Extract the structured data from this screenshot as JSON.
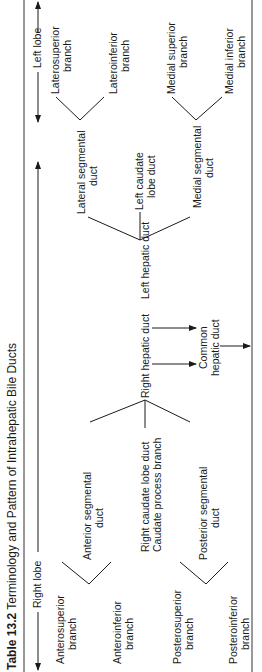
{
  "table": {
    "number": "Table 13.2",
    "title": "Terminology and Pattern of Intrahepatic Bile Ducts"
  },
  "lobes": {
    "right": "Right lobe",
    "left": "Left lobe"
  },
  "right_lobe": {
    "anterior_segmental_duct": "Anterior segmental duct",
    "anterosuperior_branch": "Anterosuperior branch",
    "anteroinferior_branch": "Anteroinferior branch",
    "posterior_segmental_duct": "Posterior segmental duct",
    "posterosuperior_branch": "Posterosuperior branch",
    "posteroinferior_branch": "Posteroinferior branch",
    "right_caudate_lobe_duct": "Right caudate lobe duct",
    "caudate_process_branch": "Caudate process branch",
    "right_hepatic_duct": "Right hepatic duct"
  },
  "left_lobe": {
    "lateral_segmental_duct": "Lateral segmental duct",
    "laterosuperior_branch": "Laterosuperior branch",
    "lateroinferior_branch": "Lateroinferior branch",
    "medial_segmental_duct": "Medial segmental duct",
    "medial_superior_branch": "Medial superior branch",
    "medial_inferior_branch": "Medial inferior branch",
    "left_caudate_lobe_duct": "Left caudate lobe duct",
    "left_hepatic_duct": "Left hepatic duct"
  },
  "common": {
    "common_hepatic_duct": "Common hepatic duct"
  },
  "labels_split": {
    "anterosuperior": [
      "Anterosuperior",
      "branch"
    ],
    "anteroinferior": [
      "Anteroinferior",
      "branch"
    ],
    "anterior_seg": [
      "Anterior segmental",
      "duct"
    ],
    "posterosuperior": [
      "Posterosuperior",
      "branch"
    ],
    "posteroinferior": [
      "Posteroinferior",
      "branch"
    ],
    "posterior_seg": [
      "Posterior segmental",
      "duct"
    ],
    "lateral_seg": [
      "Lateral segmental",
      "duct"
    ],
    "laterosuperior": [
      "Laterosuperior",
      "branch"
    ],
    "lateroinferior": [
      "Lateroinferior",
      "branch"
    ],
    "medial_seg": [
      "Medial segmental",
      "duct"
    ],
    "medial_superior": [
      "Medial superior",
      "branch"
    ],
    "medial_inferior": [
      "Medial inferior",
      "branch"
    ],
    "left_caudate": [
      "Left caudate",
      "lobe duct"
    ],
    "common_hepatic": [
      "Common",
      "hepatic duct"
    ]
  }
}
